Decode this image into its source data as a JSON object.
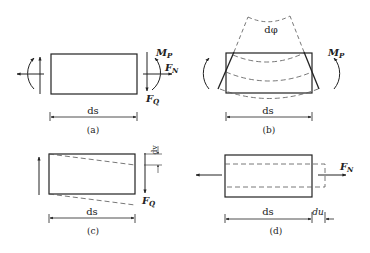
{
  "figure": {
    "panels": [
      {
        "id": "a",
        "caption": "(a)",
        "dimension_label": "ds",
        "forces": {
          "moment": "M",
          "moment_sub": "P",
          "normal": "F",
          "normal_sub": "N",
          "shear": "F",
          "shear_sub": "Q"
        }
      },
      {
        "id": "b",
        "caption": "(b)",
        "dimension_label": "ds",
        "angle_label": "dφ",
        "forces": {
          "moment": "M",
          "moment_sub": "P"
        }
      },
      {
        "id": "c",
        "caption": "(c)",
        "dimension_label": "ds",
        "deflection_label": "dv",
        "forces": {
          "shear": "F",
          "shear_sub": "Q"
        }
      },
      {
        "id": "d",
        "caption": "(d)",
        "dimension_label": "ds",
        "elongation_label": "du",
        "forces": {
          "normal": "F",
          "normal_sub": "N"
        }
      }
    ]
  },
  "colors": {
    "line": "#222222",
    "dashed": "#555555",
    "background": "#ffffff"
  }
}
